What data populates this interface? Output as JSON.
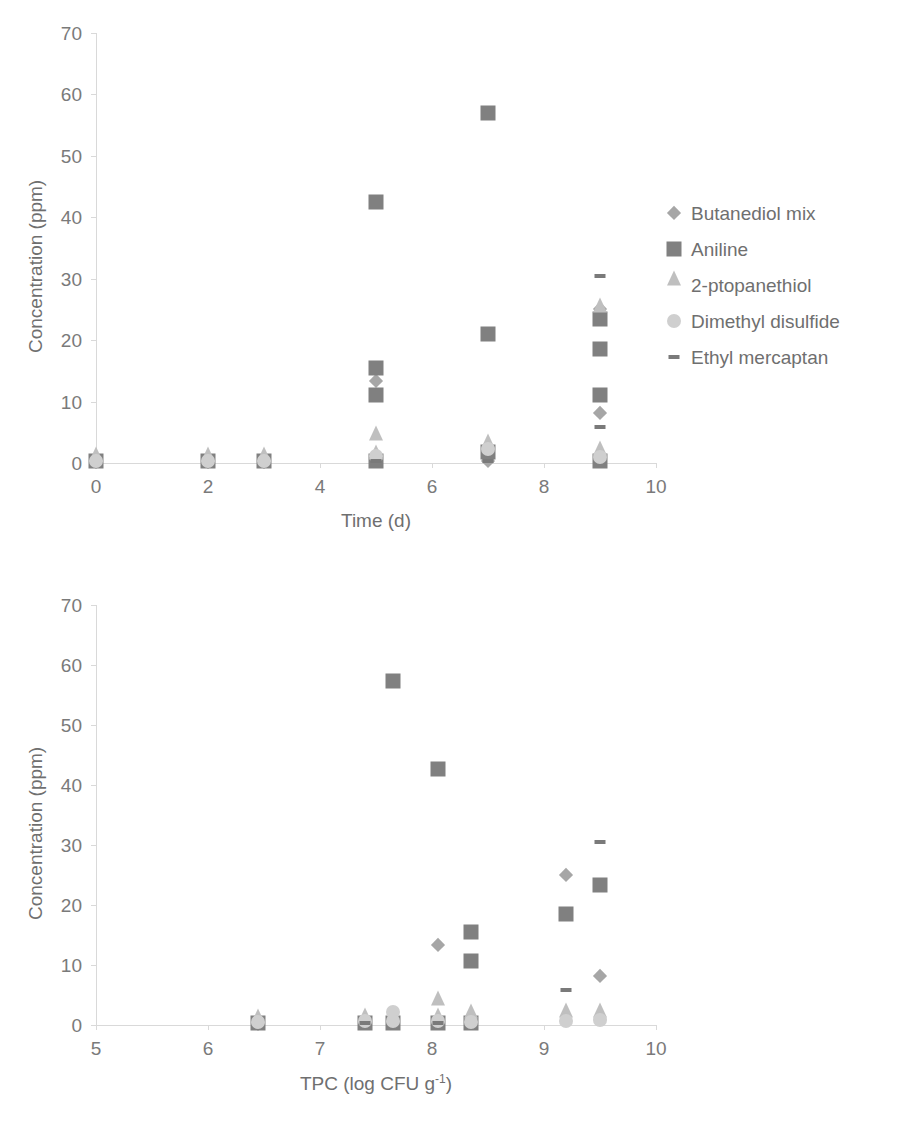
{
  "series_styles": {
    "butanediol_mix": {
      "shape": "diamond",
      "color": "#a6a6a6",
      "size": 13
    },
    "aniline": {
      "shape": "square",
      "color": "#808080",
      "size": 15
    },
    "ptopanethiol": {
      "shape": "triangle",
      "color": "#bfbfbf",
      "size": 15
    },
    "dimethyl_disulfide": {
      "shape": "circle",
      "color": "#cfcfcf",
      "size": 14
    },
    "ethyl_mercaptan": {
      "shape": "dash",
      "color": "#7a7a7a",
      "size": 11
    }
  },
  "legend": {
    "items": [
      {
        "key": "butanediol_mix",
        "label": "Butanediol mix"
      },
      {
        "key": "aniline",
        "label": "Aniline"
      },
      {
        "key": "ptopanethiol",
        "label": "2-ptopanethiol"
      },
      {
        "key": "dimethyl_disulfide",
        "label": "Dimethyl disulfide"
      },
      {
        "key": "ethyl_mercaptan",
        "label": "Ethyl mercaptan"
      }
    ]
  },
  "chart_data": [
    {
      "id": "chart-time",
      "type": "scatter",
      "title": "",
      "xlabel": "Time (d)",
      "ylabel": "Concentration (ppm)",
      "xlim": [
        0,
        10
      ],
      "ylim": [
        0,
        70
      ],
      "xticks": [
        0,
        2,
        4,
        6,
        8,
        10
      ],
      "yticks": [
        0,
        10,
        20,
        30,
        40,
        50,
        60,
        70
      ],
      "grid": false,
      "legend_position": "right",
      "series": [
        {
          "name": "Butanediol mix",
          "key": "butanediol_mix",
          "points": [
            {
              "x": 0,
              "y": 0.2
            },
            {
              "x": 2,
              "y": 0.2
            },
            {
              "x": 3,
              "y": 0.2
            },
            {
              "x": 5,
              "y": 13.3
            },
            {
              "x": 5,
              "y": 0.3
            },
            {
              "x": 7,
              "y": 0.4
            },
            {
              "x": 9.0,
              "y": 25.0
            },
            {
              "x": 9.0,
              "y": 8.2
            },
            {
              "x": 9.0,
              "y": 0.5
            }
          ]
        },
        {
          "name": "Aniline",
          "key": "aniline",
          "points": [
            {
              "x": 0,
              "y": 0.3
            },
            {
              "x": 2,
              "y": 0.3
            },
            {
              "x": 3,
              "y": 0.3
            },
            {
              "x": 5,
              "y": 42.5
            },
            {
              "x": 5,
              "y": 15.5
            },
            {
              "x": 5,
              "y": 11.0
            },
            {
              "x": 5,
              "y": 0.3
            },
            {
              "x": 7,
              "y": 57.0
            },
            {
              "x": 7,
              "y": 21.0
            },
            {
              "x": 7,
              "y": 1.8
            },
            {
              "x": 9.0,
              "y": 23.5
            },
            {
              "x": 9.0,
              "y": 18.5
            },
            {
              "x": 9.0,
              "y": 11.0
            },
            {
              "x": 9.0,
              "y": 0.4
            }
          ]
        },
        {
          "name": "2-ptopanethiol",
          "key": "ptopanethiol",
          "points": [
            {
              "x": 0,
              "y": 0.2
            },
            {
              "x": 2,
              "y": 0.2
            },
            {
              "x": 3,
              "y": 0.2
            },
            {
              "x": 5,
              "y": 3.6
            },
            {
              "x": 5,
              "y": 0.6
            },
            {
              "x": 7,
              "y": 2.4
            },
            {
              "x": 9.0,
              "y": 24.5
            },
            {
              "x": 9.0,
              "y": 1.2
            }
          ]
        },
        {
          "name": "Dimethyl disulfide",
          "key": "dimethyl_disulfide",
          "points": [
            {
              "x": 0,
              "y": 0.4
            },
            {
              "x": 2,
              "y": 0.4
            },
            {
              "x": 3,
              "y": 0.4
            },
            {
              "x": 5,
              "y": 1.2
            },
            {
              "x": 7,
              "y": 2.2
            },
            {
              "x": 9.0,
              "y": 0.9
            }
          ]
        },
        {
          "name": "Ethyl mercaptan",
          "key": "ethyl_mercaptan",
          "points": [
            {
              "x": 5,
              "y": 0.4
            },
            {
              "x": 7,
              "y": 0.4
            },
            {
              "x": 9.0,
              "y": 30.5
            },
            {
              "x": 9.0,
              "y": 5.8
            }
          ]
        }
      ]
    },
    {
      "id": "chart-tpc",
      "type": "scatter",
      "title": "",
      "xlabel": "TPC (log CFU g",
      "xlabel_sup": "-1",
      "xlabel_tail": ")",
      "ylabel": "Concentration (ppm)",
      "xlim": [
        5,
        10
      ],
      "ylim": [
        0,
        70
      ],
      "xticks": [
        5,
        6,
        7,
        8,
        9,
        10
      ],
      "yticks": [
        0,
        10,
        20,
        30,
        40,
        50,
        60,
        70
      ],
      "grid": false,
      "legend_position": "right",
      "series": [
        {
          "name": "Butanediol mix",
          "key": "butanediol_mix",
          "points": [
            {
              "x": 6.45,
              "y": 0.2
            },
            {
              "x": 7.4,
              "y": 0.3
            },
            {
              "x": 7.65,
              "y": 0.3
            },
            {
              "x": 8.05,
              "y": 13.3
            },
            {
              "x": 8.05,
              "y": 0.3
            },
            {
              "x": 8.35,
              "y": 0.3
            },
            {
              "x": 9.2,
              "y": 25.0
            },
            {
              "x": 9.5,
              "y": 8.2
            }
          ]
        },
        {
          "name": "Aniline",
          "key": "aniline",
          "points": [
            {
              "x": 6.45,
              "y": 0.3
            },
            {
              "x": 7.4,
              "y": 0.4
            },
            {
              "x": 7.65,
              "y": 57.3
            },
            {
              "x": 7.65,
              "y": 0.4
            },
            {
              "x": 8.05,
              "y": 42.7
            },
            {
              "x": 8.05,
              "y": 0.4
            },
            {
              "x": 8.35,
              "y": 15.5
            },
            {
              "x": 8.35,
              "y": 10.7
            },
            {
              "x": 8.35,
              "y": 0.3
            },
            {
              "x": 9.2,
              "y": 18.5
            },
            {
              "x": 9.5,
              "y": 23.4
            }
          ]
        },
        {
          "name": "2-ptopanethiol",
          "key": "ptopanethiol",
          "points": [
            {
              "x": 6.45,
              "y": 0.3
            },
            {
              "x": 7.4,
              "y": 0.4
            },
            {
              "x": 7.65,
              "y": 0.5
            },
            {
              "x": 8.05,
              "y": 3.3
            },
            {
              "x": 8.05,
              "y": 0.5
            },
            {
              "x": 8.35,
              "y": 1.1
            },
            {
              "x": 9.2,
              "y": 1.3
            },
            {
              "x": 9.5,
              "y": 1.2
            }
          ]
        },
        {
          "name": "Dimethyl disulfide",
          "key": "dimethyl_disulfide",
          "points": [
            {
              "x": 6.45,
              "y": 0.5
            },
            {
              "x": 7.4,
              "y": 0.6
            },
            {
              "x": 7.65,
              "y": 2.2
            },
            {
              "x": 7.65,
              "y": 0.6
            },
            {
              "x": 8.05,
              "y": 0.6
            },
            {
              "x": 8.35,
              "y": 0.5
            },
            {
              "x": 9.2,
              "y": 0.6
            },
            {
              "x": 9.5,
              "y": 0.9
            }
          ]
        },
        {
          "name": "Ethyl mercaptan",
          "key": "ethyl_mercaptan",
          "points": [
            {
              "x": 7.4,
              "y": 0.3
            },
            {
              "x": 8.05,
              "y": 0.3
            },
            {
              "x": 9.2,
              "y": 5.8
            },
            {
              "x": 9.5,
              "y": 30.5
            }
          ]
        }
      ]
    }
  ]
}
